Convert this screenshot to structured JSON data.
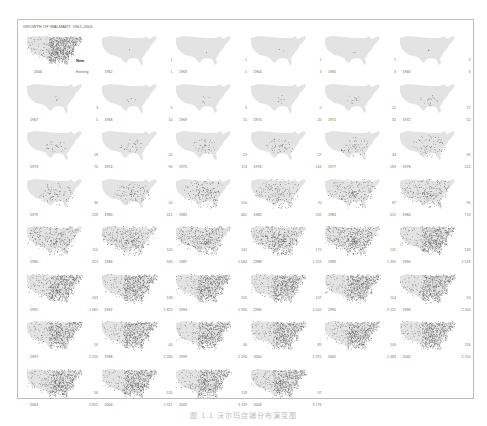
{
  "figure": {
    "title": "GROWTH OF WALMART: 1962-2006",
    "legend": {
      "year": "2006",
      "new_label": "New",
      "existing_label": "Existing"
    },
    "caption": "图 1.1 沃尔玛店铺分布演变图"
  },
  "colors": {
    "map_base": "#e3e3e3",
    "map_light": "#f0f0f0",
    "dot_new": "#111111",
    "dot_existing": "#555555",
    "frame": "#bdbdbd"
  },
  "chart_data": {
    "type": "small-multiples-map",
    "title": "GROWTH OF WALMART: 1962-2006",
    "xlabel": "",
    "ylabel": "",
    "legend": [
      "New",
      "Existing"
    ],
    "panels": [
      {
        "year": "1962",
        "new": "1",
        "total": "1"
      },
      {
        "year": "1963",
        "new": "1",
        "total": "1"
      },
      {
        "year": "1964",
        "new": "1",
        "total": "3"
      },
      {
        "year": "1965",
        "new": "1",
        "total": "3"
      },
      {
        "year": "1966",
        "new": "3",
        "total": "3"
      },
      {
        "year": "1967",
        "new": "3",
        "total": "5"
      },
      {
        "year": "1968",
        "new": "5",
        "total": "10"
      },
      {
        "year": "1969",
        "new": "3",
        "total": "15"
      },
      {
        "year": "1970",
        "new": "5",
        "total": "20"
      },
      {
        "year": "1971",
        "new": "12",
        "total": "32"
      },
      {
        "year": "1972",
        "new": "17",
        "total": "52"
      },
      {
        "year": "1973",
        "new": "18",
        "total": "70"
      },
      {
        "year": "1974",
        "new": "20",
        "total": "90"
      },
      {
        "year": "1975",
        "new": "23",
        "total": "113"
      },
      {
        "year": "1976",
        "new": "27",
        "total": "143"
      },
      {
        "year": "1977",
        "new": "34",
        "total": "183"
      },
      {
        "year": "1978",
        "new": "39",
        "total": "222"
      },
      {
        "year": "1979",
        "new": "36",
        "total": "258"
      },
      {
        "year": "1980",
        "new": "54",
        "total": "312"
      },
      {
        "year": "1981",
        "new": "150",
        "total": "462"
      },
      {
        "year": "1982",
        "new": "70",
        "total": "532"
      },
      {
        "year": "1983",
        "new": "87",
        "total": "619"
      },
      {
        "year": "1984",
        "new": "95",
        "total": "713"
      },
      {
        "year": "1985",
        "new": "110",
        "total": "823"
      },
      {
        "year": "1986",
        "new": "120",
        "total": "943"
      },
      {
        "year": "1987",
        "new": "141",
        "total": "1 084"
      },
      {
        "year": "1988",
        "new": "175",
        "total": "1 259"
      },
      {
        "year": "1989",
        "new": "131",
        "total": "1 390"
      },
      {
        "year": "1990",
        "new": "128",
        "total": "1 518"
      },
      {
        "year": "1991",
        "new": "163",
        "total": "1 681"
      },
      {
        "year": "1992",
        "new": "138",
        "total": "1 819"
      },
      {
        "year": "1993",
        "new": "116",
        "total": "1 935"
      },
      {
        "year": "1994",
        "new": "107",
        "total": "2 042"
      },
      {
        "year": "1995",
        "new": "114",
        "total": "2 151"
      },
      {
        "year": "1996",
        "new": "53",
        "total": "2 204"
      },
      {
        "year": "1997",
        "new": "16",
        "total": "2 220"
      },
      {
        "year": "1998",
        "new": "40",
        "total": "2 260"
      },
      {
        "year": "1999",
        "new": "30",
        "total": "2 290"
      },
      {
        "year": "2000",
        "new": "85",
        "total": "2 375"
      },
      {
        "year": "2001",
        "new": "109",
        "total": "2 484"
      },
      {
        "year": "2002",
        "new": "116",
        "total": "2 700"
      },
      {
        "year": "2003",
        "new": "56",
        "total": "2 852"
      },
      {
        "year": "2004",
        "new": "120",
        "total": "2 921"
      },
      {
        "year": "2005",
        "new": "118",
        "total": "3 139"
      },
      {
        "year": "2006",
        "new": "37",
        "total": "3 176"
      }
    ]
  }
}
